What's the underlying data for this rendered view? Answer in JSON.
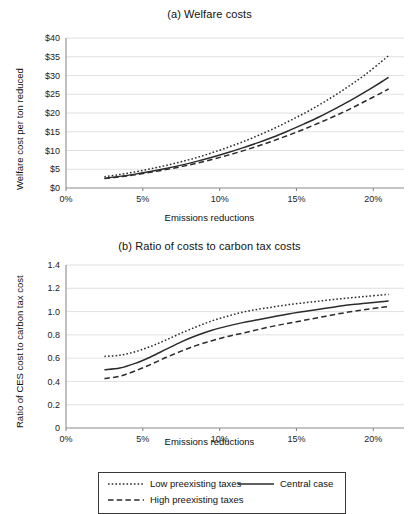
{
  "figure": {
    "width": 419,
    "height": 500,
    "background": "#ffffff",
    "line_color": "#2b2b2b",
    "grid_color": "#d9d9d9",
    "axis_color": "#8a8a8a"
  },
  "panel_a": {
    "title": "(a) Welfare costs",
    "ylabel": "Welfare cost per ton reduced",
    "xlabel": "Emissions reductions",
    "yticks": [
      "$0",
      "$5",
      "$10",
      "$15",
      "$20",
      "$25",
      "$30",
      "$35",
      "$40"
    ],
    "xticks": [
      "0%",
      "5%",
      "10%",
      "15%",
      "20%"
    ]
  },
  "panel_b": {
    "title": "(b) Ratio of costs to carbon tax costs",
    "ylabel": "Ratio of CES cost to carbon tax cost",
    "xlabel": "Emissions reductions",
    "yticks": [
      "0",
      "0.2",
      "0.4",
      "0.6",
      "0.8",
      "1.0",
      "1.2",
      "1.4"
    ],
    "xticks": [
      "0%",
      "5%",
      "10%",
      "15%",
      "20%"
    ]
  },
  "legend": {
    "low_label": "Low preexisting taxes",
    "high_label": "High preexisting taxes",
    "central_label": "Central case"
  },
  "chart_data": [
    {
      "id": "panel_a",
      "type": "line",
      "title": "(a) Welfare costs",
      "xlabel": "Emissions reductions",
      "ylabel": "Welfare cost per ton reduced",
      "xlim": [
        0,
        22
      ],
      "ylim": [
        0,
        40
      ],
      "xtick_values": [
        0,
        5,
        10,
        15,
        20
      ],
      "xtick_labels": [
        "0%",
        "5%",
        "10%",
        "15%",
        "20%"
      ],
      "ytick_values": [
        0,
        5,
        10,
        15,
        20,
        25,
        30,
        35,
        40
      ],
      "ytick_labels": [
        "$0",
        "$5",
        "$10",
        "$15",
        "$20",
        "$25",
        "$30",
        "$35",
        "$40"
      ],
      "grid": "horizontal",
      "legend_position": "below-figure",
      "x": [
        2.5,
        3.5,
        4.5,
        5.5,
        6.5,
        7.5,
        8.5,
        9.5,
        10.5,
        11.5,
        12.5,
        13.5,
        14.5,
        15.5,
        16.5,
        17.5,
        18.5,
        19.5,
        20.5,
        21.0
      ],
      "series": [
        {
          "name": "Low preexisting taxes",
          "style": "dotted",
          "values": [
            3.0,
            3.6,
            4.3,
            5.1,
            6.0,
            7.0,
            8.1,
            9.4,
            10.8,
            12.3,
            14.0,
            15.8,
            17.8,
            19.9,
            22.2,
            24.7,
            27.4,
            30.3,
            33.6,
            35.3
          ]
        },
        {
          "name": "Central case",
          "style": "solid",
          "values": [
            2.6,
            3.1,
            3.7,
            4.4,
            5.2,
            6.1,
            7.1,
            8.2,
            9.4,
            10.7,
            12.1,
            13.6,
            15.3,
            17.1,
            19.0,
            21.1,
            23.3,
            25.7,
            28.2,
            29.5
          ]
        },
        {
          "name": "High preexisting taxes",
          "style": "dashed",
          "values": [
            2.5,
            3.0,
            3.5,
            4.2,
            4.9,
            5.7,
            6.6,
            7.6,
            8.7,
            9.9,
            11.2,
            12.6,
            14.1,
            15.7,
            17.4,
            19.2,
            21.1,
            23.2,
            25.3,
            26.4
          ]
        }
      ]
    },
    {
      "id": "panel_b",
      "type": "line",
      "title": "(b) Ratio of costs to carbon tax costs",
      "xlabel": "Emissions reductions",
      "ylabel": "Ratio of CES cost to carbon tax cost",
      "xlim": [
        0,
        22
      ],
      "ylim": [
        0,
        1.4
      ],
      "xtick_values": [
        0,
        5,
        10,
        15,
        20
      ],
      "xtick_labels": [
        "0%",
        "5%",
        "10%",
        "15%",
        "20%"
      ],
      "ytick_values": [
        0,
        0.2,
        0.4,
        0.6,
        0.8,
        1.0,
        1.2,
        1.4
      ],
      "ytick_labels": [
        "0",
        "0.2",
        "0.4",
        "0.6",
        "0.8",
        "1.0",
        "1.2",
        "1.4"
      ],
      "grid": "horizontal",
      "legend_position": "below-figure",
      "x": [
        2.5,
        3.5,
        4.5,
        5.5,
        6.5,
        7.5,
        8.5,
        9.5,
        10.5,
        11.5,
        12.5,
        13.5,
        14.5,
        15.5,
        16.5,
        17.5,
        18.5,
        19.5,
        20.5,
        21.0
      ],
      "series": [
        {
          "name": "Low preexisting taxes",
          "style": "dotted",
          "values": [
            0.615,
            0.625,
            0.655,
            0.7,
            0.755,
            0.815,
            0.87,
            0.92,
            0.96,
            0.995,
            1.02,
            1.04,
            1.06,
            1.075,
            1.09,
            1.105,
            1.118,
            1.13,
            1.142,
            1.148
          ]
        },
        {
          "name": "Central case",
          "style": "solid",
          "values": [
            0.5,
            0.515,
            0.555,
            0.61,
            0.675,
            0.74,
            0.795,
            0.84,
            0.875,
            0.905,
            0.93,
            0.955,
            0.98,
            1.0,
            1.02,
            1.04,
            1.058,
            1.072,
            1.085,
            1.092
          ]
        },
        {
          "name": "High preexisting taxes",
          "style": "dashed",
          "values": [
            0.425,
            0.445,
            0.49,
            0.545,
            0.605,
            0.66,
            0.71,
            0.75,
            0.785,
            0.815,
            0.845,
            0.875,
            0.9,
            0.925,
            0.95,
            0.975,
            0.998,
            1.018,
            1.035,
            1.042
          ]
        }
      ]
    }
  ]
}
